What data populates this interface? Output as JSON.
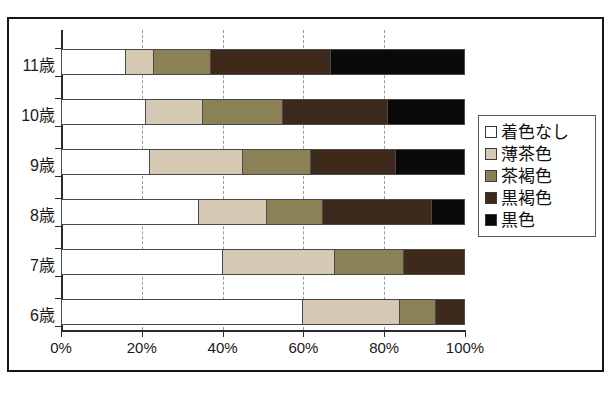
{
  "chart_data": {
    "type": "bar",
    "orientation": "horizontal",
    "stacked": true,
    "normalized_percent": true,
    "title": "",
    "xlabel": "",
    "ylabel": "",
    "xlim": [
      0,
      100
    ],
    "grid": true,
    "gridline_style": "dashed",
    "legend_position": "right",
    "categories": [
      "11歳",
      "10歳",
      "9歳",
      "8歳",
      "7歳",
      "6歳"
    ],
    "xtick_labels": [
      "0%",
      "20%",
      "40%",
      "60%",
      "80%",
      "100%"
    ],
    "xtick_values": [
      0,
      20,
      40,
      60,
      80,
      100
    ],
    "series": [
      {
        "name": "着色なし",
        "color": "#ffffff",
        "values": [
          16,
          21,
          22,
          34,
          40,
          60
        ]
      },
      {
        "name": "薄茶色",
        "color": "#d5c9b4",
        "values": [
          7,
          14,
          23,
          17,
          28,
          24
        ]
      },
      {
        "name": "茶褐色",
        "color": "#8a8156",
        "values": [
          14,
          20,
          17,
          14,
          17,
          9
        ]
      },
      {
        "name": "黒褐色",
        "color": "#3d2a1c",
        "values": [
          30,
          26,
          21,
          27,
          15,
          7
        ]
      },
      {
        "name": "黒色",
        "color": "#0a0a0a",
        "values": [
          33,
          19,
          17,
          8,
          0,
          0
        ]
      }
    ]
  },
  "legend": {
    "items": [
      {
        "label": "着色なし",
        "color": "#ffffff"
      },
      {
        "label": "薄茶色",
        "color": "#d5c9b4"
      },
      {
        "label": "茶褐色",
        "color": "#8a8156"
      },
      {
        "label": "黒褐色",
        "color": "#3d2a1c"
      },
      {
        "label": "黒色",
        "color": "#0a0a0a"
      }
    ]
  },
  "caption": ""
}
